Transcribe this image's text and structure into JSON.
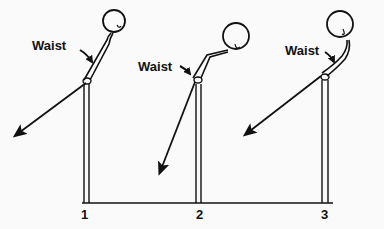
{
  "diagram": {
    "figures": [
      {
        "number": "1",
        "label": "Waist"
      },
      {
        "number": "2",
        "label": "Waist"
      },
      {
        "number": "3",
        "label": "Waist"
      }
    ]
  }
}
